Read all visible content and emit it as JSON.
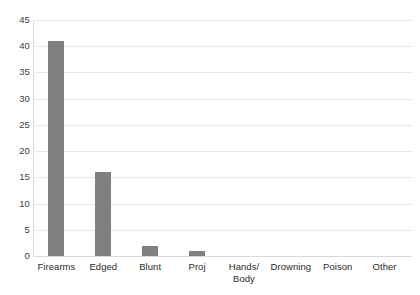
{
  "chart_data": {
    "type": "bar",
    "title": "",
    "subtitle": "",
    "xlabel": "",
    "ylabel": "",
    "categories": [
      "Firearms",
      "Edged",
      "Blunt",
      "Proj",
      "Hands/\nBody",
      "Drowning",
      "Poison",
      "Other"
    ],
    "values": [
      41,
      16,
      2,
      1,
      0,
      0,
      0,
      0
    ],
    "series": [
      {
        "name": "Count",
        "values": [
          41,
          16,
          2,
          1,
          0,
          0,
          0,
          0
        ]
      }
    ],
    "ylim": [
      0,
      45
    ],
    "yticks": [
      0,
      5,
      10,
      15,
      20,
      25,
      30,
      35,
      40,
      45
    ],
    "ytick_labels": [
      "0",
      "5",
      "10",
      "15",
      "20",
      "25",
      "30",
      "35",
      "40",
      "45"
    ],
    "grid": true,
    "grid_axis": "y",
    "legend": false,
    "legend_position": "none",
    "annotations": [],
    "colors": {
      "bar": "#808080",
      "gridline": "#e8e8e8",
      "axis": "#d9d9d9",
      "tick_label": "#404040",
      "category_label": "#2b2b2b",
      "background": "#ffffff"
    }
  }
}
